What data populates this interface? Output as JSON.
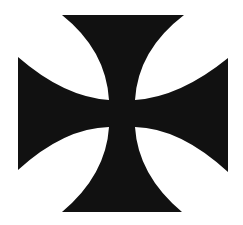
{
  "image": {
    "subject": "cross-pattee",
    "background_color": "#ffffff",
    "fill_color": "#111111"
  }
}
